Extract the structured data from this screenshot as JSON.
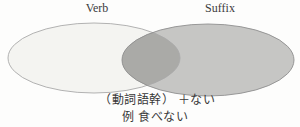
{
  "venn": {
    "left": {
      "label": "Verb",
      "fill": "#f4f4f1",
      "outline": "#a9a9a9"
    },
    "right": {
      "label": "Suffix",
      "fill": "#c6c6c4",
      "outline": "#8f8f8f"
    },
    "overlap_fill": "#aaaaa7"
  },
  "caption": {
    "formula": "（動詞語幹） ＋ない",
    "example": "例 食べない"
  }
}
